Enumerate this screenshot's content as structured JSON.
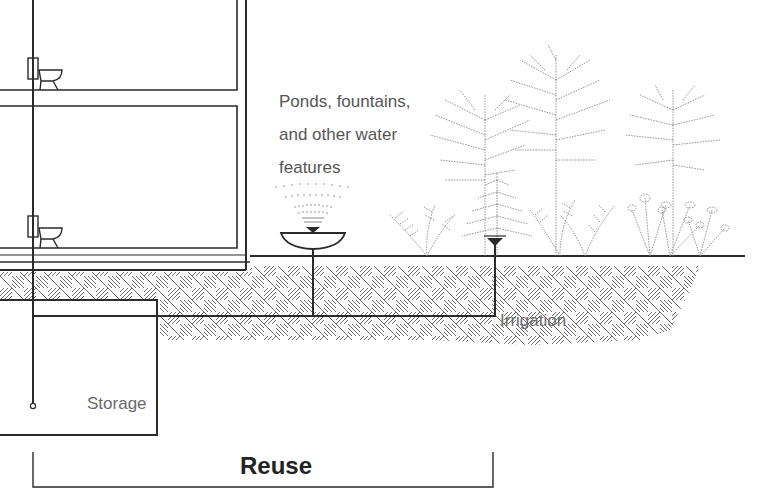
{
  "diagram": {
    "type": "rainwater-reuse-section",
    "labels": {
      "features": [
        "Ponds, fountains,",
        "and other water",
        "features"
      ],
      "irrigation": "Irrigation",
      "storage": "Storage",
      "reuse": "Reuse"
    },
    "components": [
      {
        "name": "building-section",
        "floors": 2,
        "fixtures": [
          "toilet",
          "toilet"
        ]
      },
      {
        "name": "storage-tank"
      },
      {
        "name": "fountain-basin"
      },
      {
        "name": "irrigation-sprinkler"
      },
      {
        "name": "landscape-plants",
        "items": [
          "trees",
          "shrubs",
          "ferns",
          "flowers"
        ]
      },
      {
        "name": "ground-hatching"
      },
      {
        "name": "reuse-bracket"
      }
    ],
    "colors": {
      "line": "#2a2a2a",
      "hatch": "#555555",
      "label": "#555555",
      "title": "#222222",
      "background": "#ffffff"
    }
  }
}
